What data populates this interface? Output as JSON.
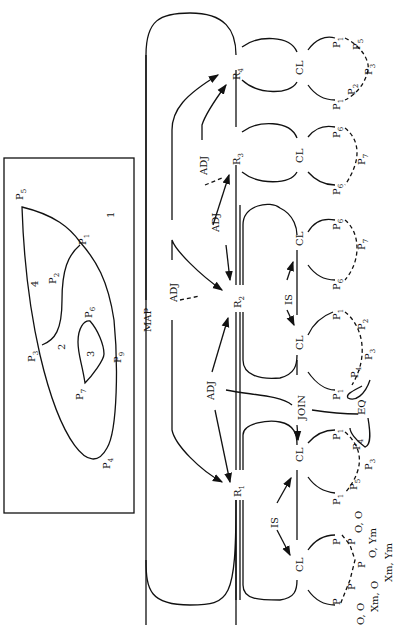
{
  "map_panel": {
    "regions": [
      "1",
      "2",
      "3",
      "4"
    ],
    "points": [
      {
        "name": "P",
        "sub": "5"
      },
      {
        "name": "P",
        "sub": "1"
      },
      {
        "name": "P",
        "sub": "2"
      },
      {
        "name": "P",
        "sub": "3"
      },
      {
        "name": "P",
        "sub": "6"
      },
      {
        "name": "P",
        "sub": "7"
      },
      {
        "name": "P",
        "sub": "9"
      },
      {
        "name": "P",
        "sub": "4"
      }
    ]
  },
  "relations": {
    "map": "MAP",
    "adj": "ADJ",
    "is": "IS",
    "join": "JOIN",
    "eq": "EQ",
    "cl": "CL"
  },
  "regions": [
    {
      "name": "R",
      "sub": "1"
    },
    {
      "name": "R",
      "sub": "2"
    },
    {
      "name": "R",
      "sub": "3"
    },
    {
      "name": "R",
      "sub": "4"
    }
  ],
  "point_chains": [
    {
      "region": "R4",
      "points": [
        "P1",
        "P5",
        "P3",
        "P2",
        "P1"
      ]
    },
    {
      "region": "R3",
      "points": [
        "P6",
        "P7",
        "P6"
      ]
    },
    {
      "region": "R2a",
      "points": [
        "P6",
        "P7",
        "P6"
      ]
    },
    {
      "region": "R2b",
      "points": [
        "P1",
        "P2",
        "P3",
        "P4",
        "P1"
      ]
    },
    {
      "region": "R1a",
      "points": [
        "P1",
        "P4",
        "P3",
        "P5",
        "P1"
      ]
    },
    {
      "region": "R1b",
      "points": [
        "P",
        "P",
        "P",
        "P",
        "P"
      ]
    }
  ],
  "coordinates": {
    "c1": "O, O",
    "c2": "O, Ym",
    "c3": "Xm, Ym",
    "c4": "Xm, O",
    "c5": "O, O"
  }
}
